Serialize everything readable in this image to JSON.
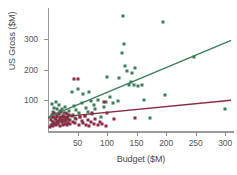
{
  "chart_data": {
    "type": "scatter",
    "title": "",
    "xlabel": "Budget ($M)",
    "ylabel": "US Gross ($M)",
    "xlim": [
      0,
      315
    ],
    "ylim": [
      0,
      400
    ],
    "grid": false,
    "legend": "none",
    "xticks": [
      50,
      100,
      150,
      200,
      250,
      300
    ],
    "xtick_labels": [
      "50",
      "100",
      "150",
      "200",
      "250",
      "300"
    ],
    "yticks": [
      100,
      200,
      300
    ],
    "ytick_labels": [
      "100",
      "200",
      "300"
    ],
    "series": [
      {
        "name": "green",
        "color": "#3c7d5b",
        "marker": "square",
        "points": [
          [
            5,
            18
          ],
          [
            6,
            46
          ],
          [
            7,
            88
          ],
          [
            8,
            30
          ],
          [
            9,
            62
          ],
          [
            10,
            25
          ],
          [
            11,
            75
          ],
          [
            12,
            40
          ],
          [
            13,
            95
          ],
          [
            14,
            55
          ],
          [
            15,
            33
          ],
          [
            16,
            70
          ],
          [
            17,
            22
          ],
          [
            18,
            58
          ],
          [
            19,
            85
          ],
          [
            20,
            38
          ],
          [
            21,
            66
          ],
          [
            22,
            44
          ],
          [
            23,
            28
          ],
          [
            24,
            72
          ],
          [
            25,
            50
          ],
          [
            26,
            36
          ],
          [
            27,
            60
          ],
          [
            28,
            42
          ],
          [
            29,
            78
          ],
          [
            30,
            31
          ],
          [
            32,
            55
          ],
          [
            34,
            47
          ],
          [
            36,
            64
          ],
          [
            38,
            35
          ],
          [
            40,
            128
          ],
          [
            42,
            52
          ],
          [
            44,
            80
          ],
          [
            46,
            41
          ],
          [
            48,
            68
          ],
          [
            50,
            135
          ],
          [
            52,
            58
          ],
          [
            55,
            44
          ],
          [
            58,
            90
          ],
          [
            60,
            120
          ],
          [
            62,
            49
          ],
          [
            65,
            75
          ],
          [
            68,
            62
          ],
          [
            70,
            128
          ],
          [
            72,
            96
          ],
          [
            75,
            54
          ],
          [
            78,
            85
          ],
          [
            80,
            70
          ],
          [
            85,
            100
          ],
          [
            90,
            45
          ],
          [
            95,
            78
          ],
          [
            98,
            95
          ],
          [
            100,
            175
          ],
          [
            105,
            110
          ],
          [
            110,
            90
          ],
          [
            118,
            98
          ],
          [
            120,
            172
          ],
          [
            125,
            255
          ],
          [
            127,
            375
          ],
          [
            128,
            283
          ],
          [
            130,
            212
          ],
          [
            133,
            195
          ],
          [
            138,
            148
          ],
          [
            140,
            160
          ],
          [
            143,
            188
          ],
          [
            145,
            150
          ],
          [
            148,
            204
          ],
          [
            152,
            145
          ],
          [
            160,
            150
          ],
          [
            163,
            102
          ],
          [
            172,
            42
          ],
          [
            195,
            355
          ],
          [
            198,
            118
          ],
          [
            248,
            240
          ],
          [
            300,
            70
          ]
        ]
      },
      {
        "name": "maroon",
        "color": "#8d2a43",
        "marker": "square",
        "points": [
          [
            4,
            12
          ],
          [
            5,
            35
          ],
          [
            6,
            20
          ],
          [
            7,
            52
          ],
          [
            8,
            28
          ],
          [
            9,
            15
          ],
          [
            10,
            44
          ],
          [
            11,
            60
          ],
          [
            12,
            22
          ],
          [
            13,
            38
          ],
          [
            14,
            18
          ],
          [
            15,
            48
          ],
          [
            16,
            30
          ],
          [
            17,
            25
          ],
          [
            18,
            55
          ],
          [
            19,
            33
          ],
          [
            20,
            41
          ],
          [
            21,
            16
          ],
          [
            22,
            62
          ],
          [
            23,
            36
          ],
          [
            24,
            28
          ],
          [
            25,
            50
          ],
          [
            26,
            20
          ],
          [
            27,
            45
          ],
          [
            28,
            32
          ],
          [
            29,
            24
          ],
          [
            30,
            58
          ],
          [
            31,
            38
          ],
          [
            32,
            18
          ],
          [
            33,
            42
          ],
          [
            34,
            27
          ],
          [
            35,
            52
          ],
          [
            36,
            35
          ],
          [
            38,
            22
          ],
          [
            40,
            48
          ],
          [
            42,
            30
          ],
          [
            44,
            168
          ],
          [
            45,
            25
          ],
          [
            48,
            40
          ],
          [
            50,
            168
          ],
          [
            52,
            18
          ],
          [
            55,
            44
          ],
          [
            58,
            32
          ],
          [
            60,
            26
          ],
          [
            62,
            50
          ],
          [
            65,
            20
          ],
          [
            68,
            36
          ],
          [
            70,
            15
          ],
          [
            72,
            30
          ],
          [
            75,
            58
          ],
          [
            78,
            24
          ],
          [
            80,
            38
          ],
          [
            85,
            18
          ],
          [
            88,
            28
          ],
          [
            92,
            22
          ],
          [
            95,
            95
          ],
          [
            98,
            16
          ],
          [
            100,
            58
          ],
          [
            112,
            40
          ],
          [
            148,
            42
          ]
        ]
      }
    ],
    "trend_lines": [
      {
        "name": "green-trend",
        "color": "#3c7d5b",
        "x0": 0,
        "y0": 45,
        "x1": 310,
        "y1": 295
      },
      {
        "name": "maroon-trend",
        "color": "#8d2a43",
        "x0": 0,
        "y0": 42,
        "x1": 310,
        "y1": 100
      }
    ]
  }
}
